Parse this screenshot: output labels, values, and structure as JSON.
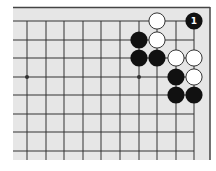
{
  "diagram": {
    "type": "go-board-fragment",
    "colors": {
      "board_bg": "#e6e6e6",
      "line": "#333333",
      "border": "#444444",
      "black_stone": "#111111",
      "white_stone": "#ffffff",
      "white_stone_outline": "#333333",
      "label_on_black": "#ffffff"
    },
    "grid": {
      "columns": 10,
      "rows": 8,
      "x": [
        27,
        46,
        64,
        83,
        101,
        120,
        139,
        157,
        176,
        194
      ],
      "y": [
        21,
        40,
        58,
        77,
        95,
        114,
        132,
        151
      ],
      "top_edge": true,
      "right_edge": true
    },
    "star_points": [
      {
        "col": 0,
        "row": 3
      },
      {
        "col": 6,
        "row": 3
      }
    ],
    "stones": [
      {
        "color": "white",
        "col": 7,
        "row": 0
      },
      {
        "color": "white",
        "col": 7,
        "row": 1
      },
      {
        "color": "white",
        "col": 8,
        "row": 2
      },
      {
        "color": "white",
        "col": 9,
        "row": 2
      },
      {
        "color": "white",
        "col": 9,
        "row": 3
      },
      {
        "color": "black",
        "col": 6,
        "row": 1
      },
      {
        "color": "black",
        "col": 6,
        "row": 2
      },
      {
        "color": "black",
        "col": 7,
        "row": 2
      },
      {
        "color": "black",
        "col": 8,
        "row": 3
      },
      {
        "color": "black",
        "col": 8,
        "row": 4
      },
      {
        "color": "black",
        "col": 9,
        "row": 4
      },
      {
        "color": "black",
        "col": 9,
        "row": 0,
        "label": "1"
      }
    ]
  }
}
